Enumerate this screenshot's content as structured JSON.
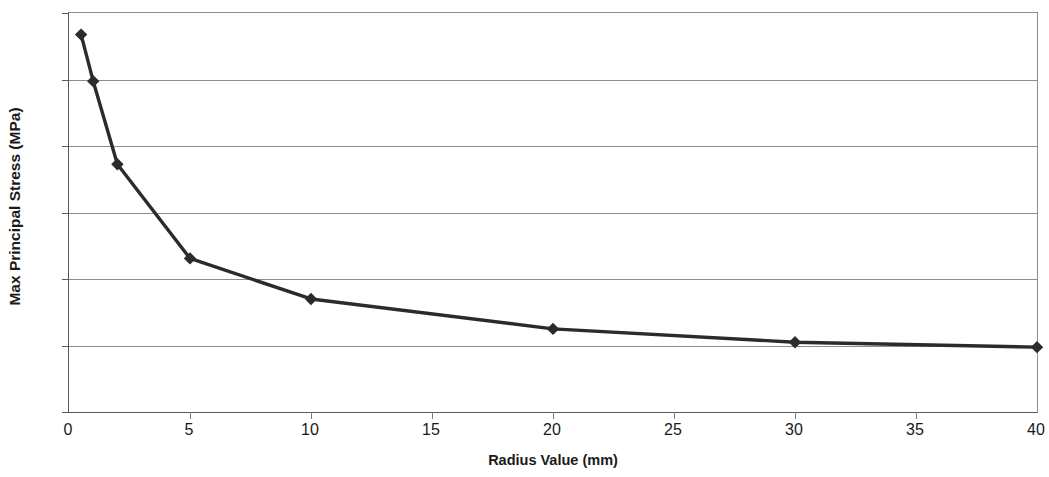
{
  "chart_data": {
    "type": "line",
    "title": "",
    "xlabel": "Radius Value (mm)",
    "ylabel": "Max Principal Stress (MPa)",
    "xlim": [
      0,
      40
    ],
    "ylim": [
      0,
      120
    ],
    "xticks": [
      0,
      5,
      10,
      15,
      20,
      25,
      30,
      35,
      40
    ],
    "yticks": [
      0,
      20,
      40,
      60,
      80,
      100,
      120
    ],
    "grid": "horizontal",
    "legend": "none",
    "series": [
      {
        "name": "Max Principal Stress",
        "marker": "diamond",
        "color": "#2b2b2b",
        "x": [
          0.5,
          1,
          2,
          5,
          10,
          20,
          30,
          40
        ],
        "y": [
          113.5,
          99.5,
          74.5,
          46.2,
          34,
          25,
          21,
          19.5
        ]
      }
    ]
  },
  "axes": {
    "x_title": "Radius Value (mm)",
    "y_title": "Max Principal Stress (MPa)",
    "x_tick_labels": [
      "0",
      "5",
      "10",
      "15",
      "20",
      "25",
      "30",
      "35",
      "40"
    ],
    "y_tick_labels": [
      "0",
      "20",
      "40",
      "60",
      "80",
      "100",
      "120"
    ]
  },
  "colors": {
    "series": "#2b2b2b",
    "gridline": "#8d8d8d",
    "axis": "#5a5a5a",
    "background": "#ffffff",
    "text": "#1a1a1a"
  }
}
